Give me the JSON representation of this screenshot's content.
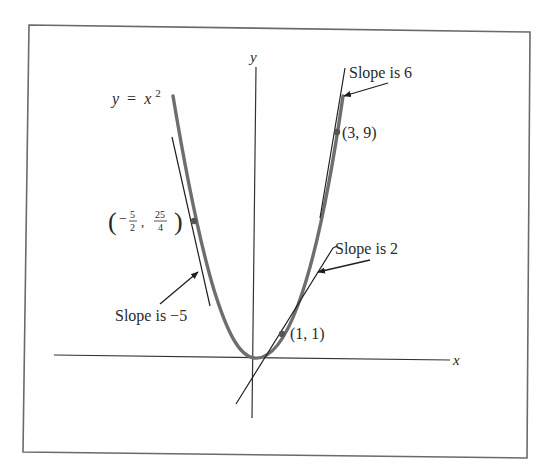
{
  "figure": {
    "curve_label": {
      "lhs": "y",
      "eq": "=",
      "var": "x",
      "exp": "2"
    },
    "axes": {
      "x_label": "x",
      "y_label": "y"
    },
    "points": [
      {
        "id": "p1",
        "label": "(1, 1)",
        "x": 1,
        "y": 1,
        "slope": 2
      },
      {
        "id": "p2",
        "label": "(3, 9)",
        "x": 3,
        "y": 9,
        "slope": 6
      },
      {
        "id": "p3",
        "label_num_x": "5",
        "label_den_x": "2",
        "label_num_y": "25",
        "label_den_y": "4",
        "x": -2.5,
        "y": 6.25,
        "slope": -5
      }
    ],
    "annotations": {
      "slope6": "Slope is 6",
      "slope2": "Slope is 2",
      "slope_neg5": "Slope is −5"
    },
    "colors": {
      "curve": "#6e6e6e",
      "line": "#1e1e1e",
      "frame": "#6a6a6a"
    }
  }
}
